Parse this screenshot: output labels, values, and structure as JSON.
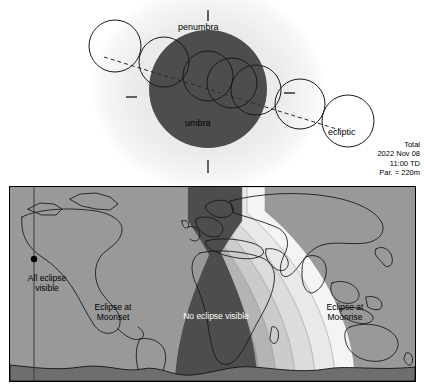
{
  "figure": {
    "type": "lunar-eclipse-diagram",
    "title_block": {
      "kind": "Total",
      "date": "2022 Nov 08",
      "time": "11:00 TD",
      "parallax": "Par. = 220m"
    }
  },
  "geometry": {
    "penumbra_label": "penumbra",
    "umbra_label": "umbra",
    "ecliptic_label": "ecliptic",
    "colors": {
      "penumbra_fill": "#ececec",
      "umbra_fill": "#4d4d4d",
      "moon_outline": "#1a1a1a",
      "ecliptic_line": "#333333"
    },
    "umbra": {
      "cx": 208,
      "cy": 89,
      "r": 59
    },
    "penumbra": {
      "cx": 208,
      "cy": 89,
      "rx": 117,
      "ry": 103
    },
    "moon_positions": [
      {
        "cx": 115,
        "cy": 46,
        "r": 26,
        "phase": "P1"
      },
      {
        "cx": 164,
        "cy": 62,
        "r": 25,
        "phase": "U1"
      },
      {
        "cx": 208,
        "cy": 76,
        "r": 25,
        "phase": "U2"
      },
      {
        "cx": 232,
        "cy": 83,
        "r": 25,
        "phase": "Greatest"
      },
      {
        "cx": 256,
        "cy": 90,
        "r": 25,
        "phase": "U3"
      },
      {
        "cx": 300,
        "cy": 104,
        "r": 25,
        "phase": "U4"
      },
      {
        "cx": 348,
        "cy": 121,
        "r": 26,
        "phase": "P4"
      }
    ],
    "tick_marks": [
      {
        "name": "penumbra-top-tick",
        "orientation": "vertical",
        "x": 208,
        "y1": 10,
        "y2": 20
      },
      {
        "name": "penumbra-bottom-tick",
        "orientation": "vertical",
        "x": 208,
        "y1": 160,
        "y2": 172
      },
      {
        "name": "umbra-left-tick",
        "orientation": "horizontal",
        "y": 97,
        "x1": 126,
        "x2": 137
      },
      {
        "name": "umbra-right-tick",
        "orientation": "horizontal",
        "y": 93,
        "x1": 284,
        "x2": 295
      }
    ]
  },
  "map": {
    "labels": {
      "all_visible": "All eclipse visible",
      "moonset": "Eclipse at Moonset",
      "no_visible": "No eclipse visible",
      "moonrise": "Eclipse at Moonrise"
    },
    "label_lines": {
      "all_visible": [
        "All eclipse",
        "visible"
      ],
      "moonset": [
        "Eclipse at",
        "Moonset"
      ],
      "no_visible": [
        "No eclipse visible"
      ],
      "moonrise": [
        "Eclipse at",
        "Moonrise"
      ]
    },
    "band_colors": [
      "#ffffff",
      "#f2f2f2",
      "#e3e3e3",
      "#d2d2d2",
      "#bcbcbc",
      "#9e9e9e",
      "#7d7d7d",
      "#5c5c5c",
      "#4a4a4a"
    ],
    "sublunar_point": {
      "x": 24,
      "y": 72,
      "label": "sub-lunar-point"
    },
    "coastline_color": "#141414",
    "border_color": "#000000",
    "antarctica_color": "#6e6e6e"
  }
}
